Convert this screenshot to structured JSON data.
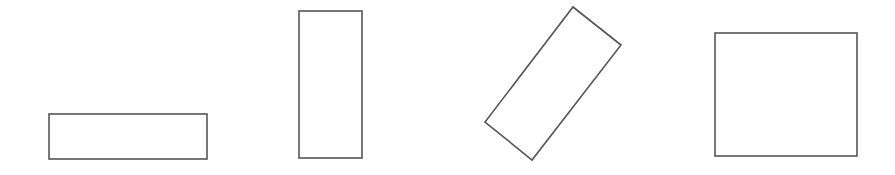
{
  "diagram": {
    "stroke_color": "#555555",
    "background": "#ffffff",
    "shapes": [
      {
        "name": "wide-rectangle",
        "type": "rect",
        "x": 49,
        "y": 114,
        "width": 158,
        "height": 45
      },
      {
        "name": "tall-rectangle",
        "type": "rect",
        "x": 299,
        "y": 11,
        "width": 63,
        "height": 147
      },
      {
        "name": "rotated-rectangle",
        "type": "polygon",
        "points": "573,7 621,45 532,160 485,122"
      },
      {
        "name": "square-ish-rectangle",
        "type": "rect",
        "x": 715,
        "y": 33,
        "width": 142,
        "height": 123
      }
    ]
  }
}
